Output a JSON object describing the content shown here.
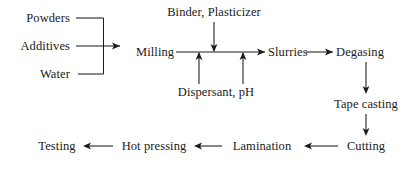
{
  "diagram": {
    "background_color": "#ffffff",
    "line_color": "#1a1a1a",
    "text_color": "#1a1a1a",
    "nodes": {
      "powders": {
        "label": "Powders",
        "x": 70,
        "y": 18,
        "align": "right"
      },
      "additives": {
        "label": "Additives",
        "x": 70,
        "y": 46,
        "align": "right"
      },
      "water": {
        "label": "Water",
        "x": 70,
        "y": 74,
        "align": "right"
      },
      "milling": {
        "label": "Milling",
        "x": 136,
        "y": 52,
        "align": "left"
      },
      "binder_plasticizer": {
        "label": "Binder, Plasticizer",
        "x": 214,
        "y": 12,
        "align": "mid"
      },
      "dispersant_ph": {
        "label": "Dispersant, pH",
        "x": 216,
        "y": 92,
        "align": "mid"
      },
      "slurries": {
        "label": "Slurries",
        "x": 268,
        "y": 52,
        "align": "left"
      },
      "degasing": {
        "label": "Degasing",
        "x": 336,
        "y": 52,
        "align": "left"
      },
      "tape_casting": {
        "label": "Tape casting",
        "x": 366,
        "y": 104,
        "align": "mid"
      },
      "cutting": {
        "label": "Cutting",
        "x": 366,
        "y": 146,
        "align": "mid"
      },
      "lamination": {
        "label": "Lamination",
        "x": 262,
        "y": 146,
        "align": "mid"
      },
      "hot_pressing": {
        "label": "Hot pressing",
        "x": 154,
        "y": 146,
        "align": "mid"
      },
      "testing": {
        "label": "Testing",
        "x": 57,
        "y": 146,
        "align": "mid"
      }
    },
    "connections": [
      {
        "name": "powders-to-bracket",
        "from": "Powders",
        "to": "Milling"
      },
      {
        "name": "additives-to-milling",
        "from": "Additives",
        "to": "Milling"
      },
      {
        "name": "water-to-bracket",
        "from": "Water",
        "to": "Milling"
      },
      {
        "name": "milling-to-slurries",
        "from": "Milling",
        "to": "Slurries"
      },
      {
        "name": "binder-to-milling-line",
        "from": "Binder, Plasticizer",
        "to": "Milling"
      },
      {
        "name": "dispersant-to-milling-line-left",
        "from": "Dispersant, pH",
        "to": "Milling"
      },
      {
        "name": "dispersant-to-milling-line-right",
        "from": "Dispersant, pH",
        "to": "Milling"
      },
      {
        "name": "slurries-to-degasing",
        "from": "Slurries",
        "to": "Degasing"
      },
      {
        "name": "degasing-to-tape-casting",
        "from": "Degasing",
        "to": "Tape casting"
      },
      {
        "name": "tape-casting-to-cutting",
        "from": "Tape casting",
        "to": "Cutting"
      },
      {
        "name": "cutting-to-lamination",
        "from": "Cutting",
        "to": "Lamination"
      },
      {
        "name": "lamination-to-hot-pressing",
        "from": "Lamination",
        "to": "Hot pressing"
      },
      {
        "name": "hot-pressing-to-testing",
        "from": "Hot pressing",
        "to": "Testing"
      }
    ]
  }
}
